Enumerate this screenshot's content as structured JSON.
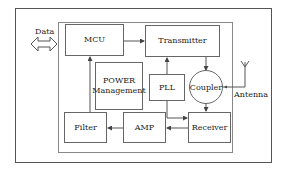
{
  "diagram": {
    "type": "block-diagram",
    "blocks": {
      "mcu": "MCU",
      "transmitter": "Transmitter",
      "power_line1": "POWER",
      "power_line2": "Management",
      "pll": "PLL",
      "coupler": "Coupler",
      "filter": "Filter",
      "amp": "AMP",
      "receiver": "Receiver"
    },
    "labels": {
      "data": "Data",
      "antenna": "Antenna"
    },
    "connections": [
      {
        "from": "Data",
        "to": "MCU",
        "kind": "bidirectional"
      },
      {
        "from": "MCU",
        "to": "Transmitter"
      },
      {
        "from": "PLL",
        "to": "Transmitter"
      },
      {
        "from": "PLL",
        "to": "Receiver"
      },
      {
        "from": "Transmitter",
        "to": "Coupler"
      },
      {
        "from": "Coupler",
        "to": "Antenna"
      },
      {
        "from": "Coupler",
        "to": "Receiver"
      },
      {
        "from": "Receiver",
        "to": "AMP"
      },
      {
        "from": "AMP",
        "to": "Filter"
      },
      {
        "from": "Filter",
        "to": "MCU"
      }
    ],
    "colors": {
      "line": "#555555",
      "background": "#ffffff"
    }
  }
}
